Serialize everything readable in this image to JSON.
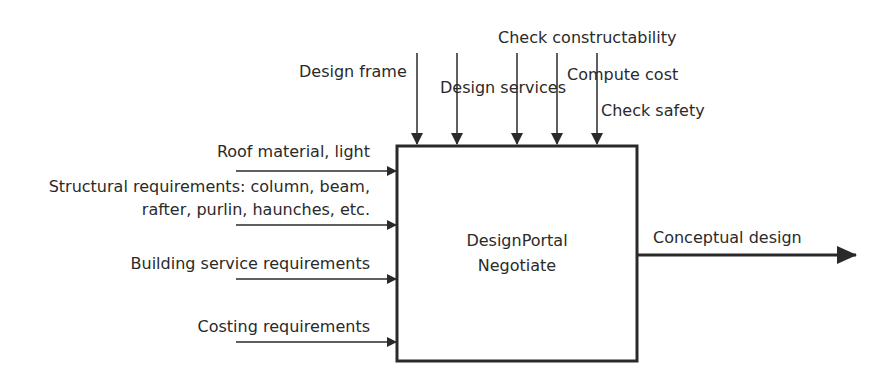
{
  "diagram": {
    "type": "IDEF0 activity box",
    "activity": {
      "line1": "DesignPortal",
      "line2": "Negotiate"
    },
    "controls": [
      {
        "label": "Design frame"
      },
      {
        "label": "Design services"
      },
      {
        "label": "Check constructability"
      },
      {
        "label": "Compute cost"
      },
      {
        "label": "Check safety"
      }
    ],
    "inputs": [
      {
        "label": "Roof material, light"
      },
      {
        "label_line1": "Structural requirements: column, beam,",
        "label_line2": "rafter, purlin, haunches, etc."
      },
      {
        "label": "Building service requirements"
      },
      {
        "label": "Costing requirements"
      }
    ],
    "output": {
      "label": "Conceptual design"
    },
    "colors": {
      "stroke": "#2a2a2a",
      "background": "#ffffff"
    }
  }
}
